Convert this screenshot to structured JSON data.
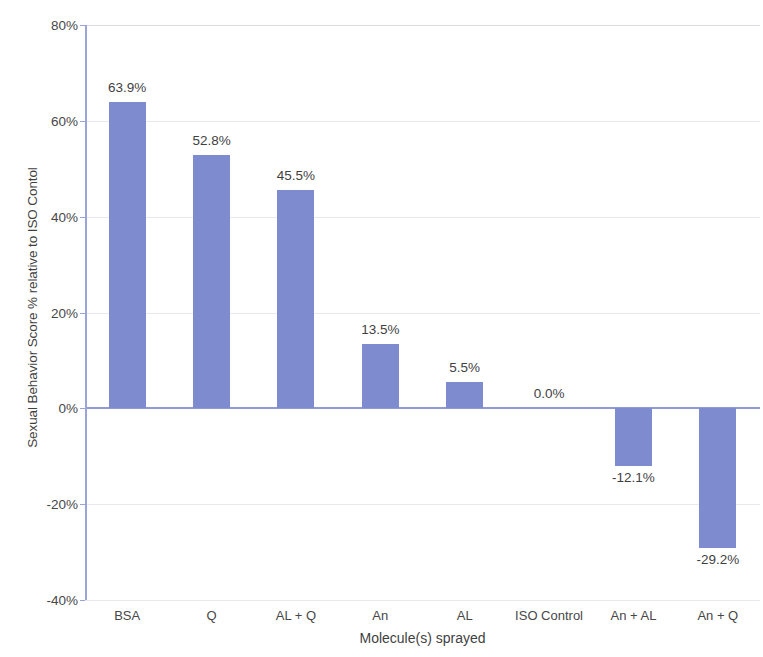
{
  "chart_data": {
    "type": "bar",
    "title": "",
    "xlabel": "Molecule(s) sprayed",
    "ylabel": "Sexual Behavior Score % relative to ISO Contol",
    "categories": [
      "BSA",
      "Q",
      "AL + Q",
      "An",
      "AL",
      "ISO Control",
      "An + AL",
      "An + Q"
    ],
    "values": [
      63.9,
      52.8,
      45.5,
      13.5,
      5.5,
      0.0,
      -12.1,
      -29.2
    ],
    "data_labels": [
      "63.9%",
      "52.8%",
      "45.5%",
      "13.5%",
      "5.5%",
      "0.0%",
      "-12.1%",
      "-29.2%"
    ],
    "ylim": [
      -40,
      80
    ],
    "y_ticks": [
      80,
      60,
      40,
      20,
      0,
      -20,
      -40
    ],
    "y_tick_labels": [
      "80%",
      "60%",
      "40%",
      "20%",
      "0%",
      "-20%",
      "-40%"
    ],
    "grid": true,
    "legend": "none",
    "bar_color": "#7e8bce",
    "axis_color": "#9aa4d8",
    "gridline_color": "#e8e8ef"
  }
}
